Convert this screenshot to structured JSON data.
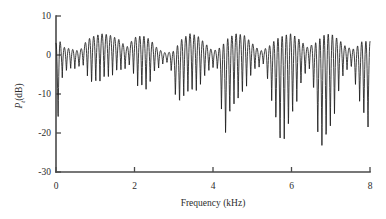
{
  "chart_data": {
    "type": "line",
    "title": "",
    "subtitle": "",
    "xlabel": "Frequency (kHz)",
    "ylabel": "P_t (dB)",
    "ylabel_base": "P",
    "ylabel_sub": "t",
    "ylabel_unit": "(dB)",
    "xlim": [
      0,
      8
    ],
    "ylim": [
      -30,
      10
    ],
    "xticks": [
      0,
      2,
      4,
      6,
      8
    ],
    "xticklabels": [
      "0",
      "2",
      "4",
      "6",
      "8"
    ],
    "yticks": [
      10,
      0,
      -10,
      -20,
      -30
    ],
    "yticklabels": [
      "10",
      "0",
      "-10",
      "-20",
      "-30"
    ],
    "grid": false,
    "legend": null,
    "line_color": "#1c1c1c",
    "axis_color": "#4a4a4a",
    "background_color": "#ffffff",
    "series": [
      {
        "name": "transmitted power spectrum",
        "description": "Densely oscillating interference spectrum with ~75 fringes across 0-8 kHz, peak maxima near +5 dB, baseline minima near -5 dB, and deep periodic nulls reaching -18 to -26 dB at group boundaries.",
        "n_points": 1601,
        "peak_max_db": 5.5,
        "deepest_null_db": -26,
        "fringe_count": 75,
        "fringe_spacing_khz": 0.1067,
        "envelope_period_khz": 1.05,
        "x": [
          0.0,
          0.05,
          0.1,
          0.15,
          0.2,
          0.3,
          0.4,
          0.5,
          0.6,
          0.7,
          0.8,
          0.9,
          1.0,
          1.1,
          1.2,
          1.3,
          1.4,
          1.5,
          1.6,
          1.7,
          1.8,
          1.9,
          2.0,
          2.1,
          2.2,
          2.3,
          2.4,
          2.5,
          2.6,
          2.7,
          2.8,
          2.9,
          3.0,
          3.1,
          3.2,
          3.3,
          3.4,
          3.5,
          3.6,
          3.7,
          3.8,
          3.9,
          4.0,
          4.1,
          4.2,
          4.3,
          4.4,
          4.5,
          4.6,
          4.7,
          4.8,
          4.9,
          5.0,
          5.1,
          5.2,
          5.3,
          5.4,
          5.5,
          5.6,
          5.7,
          5.8,
          5.9,
          6.0,
          6.1,
          6.2,
          6.3,
          6.4,
          6.5,
          6.6,
          6.7,
          6.8,
          6.9,
          7.0,
          7.1,
          7.2,
          7.3,
          7.4,
          7.5,
          7.6,
          7.7,
          7.8,
          7.9,
          8.0
        ],
        "y": [
          3.0,
          -18.0,
          3.5,
          -6.0,
          2.0,
          -4.0,
          1.5,
          -3.5,
          1.0,
          -3.0,
          4.0,
          -8.0,
          5.0,
          -7.0,
          5.5,
          -6.5,
          5.0,
          -5.0,
          4.0,
          -4.0,
          2.0,
          -3.0,
          4.5,
          -9.0,
          5.0,
          -9.5,
          4.0,
          -5.0,
          1.5,
          -2.5,
          0.5,
          -2.0,
          1.0,
          -14.5,
          4.0,
          -10.0,
          5.5,
          -10.5,
          5.0,
          -8.0,
          3.0,
          -4.0,
          1.0,
          -3.0,
          2.0,
          -22.5,
          4.5,
          -13.0,
          5.5,
          -12.0,
          5.0,
          -7.0,
          3.0,
          -3.5,
          1.0,
          -2.5,
          2.0,
          -12.0,
          4.0,
          -23.5,
          5.0,
          -20.5,
          5.5,
          -13.5,
          4.0,
          -6.0,
          2.0,
          -3.0,
          3.0,
          -24.5,
          5.0,
          -23.0,
          5.5,
          -15.5,
          4.0,
          -6.0,
          2.0,
          -2.5,
          1.5,
          -11.0,
          3.5,
          -19.5,
          3.5
        ]
      }
    ]
  },
  "figure": {
    "plot_left_px": 56,
    "plot_right_px": 370,
    "plot_top_px": 16,
    "plot_bottom_px": 172
  }
}
